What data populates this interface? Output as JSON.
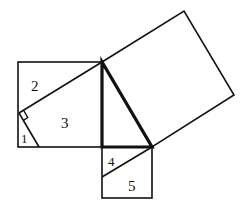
{
  "diagram": {
    "labels": {
      "piece_1": "1",
      "piece_2": "2",
      "piece_3": "3",
      "piece_4": "4",
      "piece_5": "5"
    },
    "colors": {
      "stroke": "#111111",
      "background": "#ffffff"
    }
  }
}
